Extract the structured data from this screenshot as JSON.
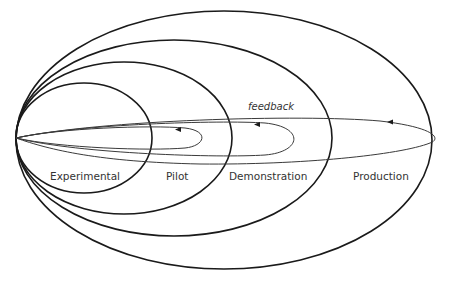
{
  "diagram": {
    "stages": [
      {
        "label": "Experimental",
        "cx": 84,
        "cy": 138,
        "rx": 68,
        "ry": 55,
        "label_x": 66,
        "label_y": 180
      },
      {
        "label": "Pilot",
        "cx": 124,
        "cy": 138,
        "rx": 108,
        "ry": 76,
        "label_x": 178,
        "label_y": 180
      },
      {
        "label": "Demonstration",
        "cx": 174,
        "cy": 138,
        "rx": 158,
        "ry": 98,
        "label_x": 264,
        "label_y": 180
      },
      {
        "label": "Production",
        "cx": 224,
        "cy": 140,
        "rx": 208,
        "ry": 129,
        "label_x": 378,
        "label_y": 180
      }
    ],
    "feedback_label": "feedback",
    "feedback_loops": [
      {
        "tip_x": 200,
        "top_y": 127,
        "bottom_y": 150,
        "arrow_x": 178
      },
      {
        "tip_x": 297,
        "top_y": 122,
        "bottom_y": 156,
        "arrow_x": 255
      },
      {
        "tip_x": 432,
        "top_y": 116,
        "bottom_y": 165,
        "arrow_x": 390
      }
    ],
    "colors": {
      "stroke": "#1a1a1a",
      "text": "#333333",
      "background": "#ffffff"
    }
  }
}
